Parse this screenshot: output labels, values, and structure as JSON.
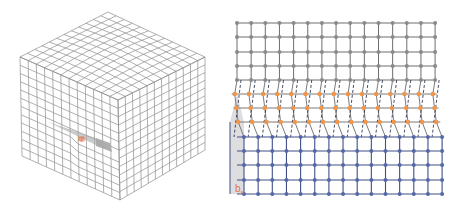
{
  "figure": {
    "left_panel": {
      "name": "dislocation-cube-3d",
      "core_label": "b",
      "colors": {
        "grid": "#8c8c8c",
        "slip_plane": "#a9a9a9",
        "core": "#e0674a"
      }
    },
    "right_panel": {
      "name": "dislocation-lattice-2d",
      "burgers_label": "b",
      "burgers_subscript": "s",
      "columns": 15,
      "gray_rows": 5,
      "orange_rows": 3,
      "blue_rows": 5,
      "colors": {
        "gray_atoms": "#8a8a8a",
        "gray_lines": "#6e6e6e",
        "orange_atoms": "#f0954a",
        "orange_lines": "#7a7a7a",
        "dashed_lines": "#2f3b57",
        "blue_atoms": "#5468a8",
        "blue_lines": "#3f4f86",
        "burgers_box": "#d8d8dc",
        "label": "#d9764a"
      }
    }
  }
}
